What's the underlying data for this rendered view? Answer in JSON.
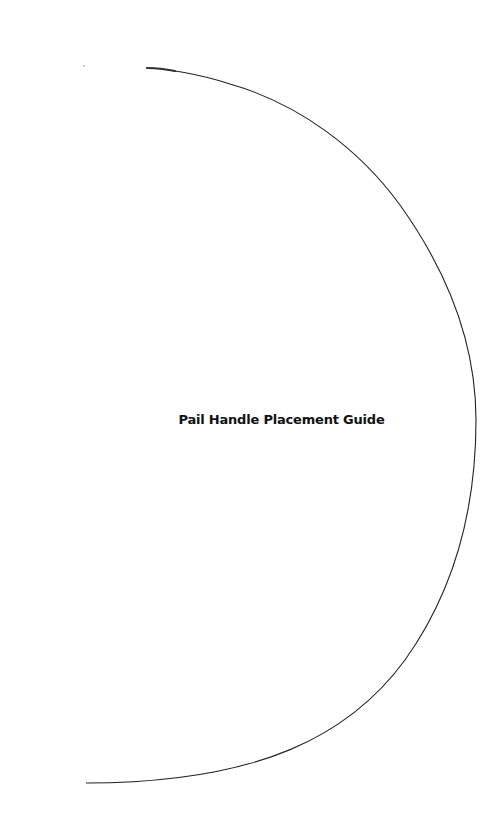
{
  "diagram": {
    "title": "Pail Handle Placement Guide",
    "arc": {
      "stroke_color": "#222222",
      "start": [
        147,
        68
      ],
      "apex": [
        476,
        420
      ],
      "end": [
        86,
        783
      ]
    }
  }
}
